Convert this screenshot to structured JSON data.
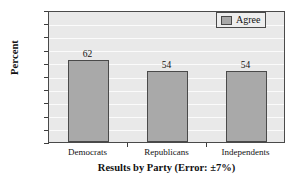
{
  "chart_data": {
    "type": "bar",
    "title": "",
    "categories": [
      "Democrats",
      "Republicans",
      "Independents"
    ],
    "values": [
      62,
      54,
      54
    ],
    "series": [
      {
        "name": "Agree",
        "values": [
          62,
          54,
          54
        ]
      }
    ],
    "xlabel": "Results by Party (Error: ±7%)",
    "ylabel": "Percent",
    "ylim": [
      0,
      100
    ],
    "yticks": [
      0,
      10,
      20,
      30,
      40,
      50,
      60,
      70,
      80,
      90,
      100
    ],
    "ytick_labels": [
      "0",
      "10",
      "20",
      "30",
      "40",
      "50",
      "60",
      "70",
      "80",
      "90",
      "100"
    ],
    "grid": true,
    "legend_position": "top-right",
    "bar_labels": [
      "62",
      "54",
      "54"
    ],
    "colors": {
      "bar_fill": "#a9a9a9",
      "bar_edge": "#4a4a4a",
      "plot_background": "#e9e9e9",
      "gridline": "#fbfbfb",
      "axis": "#4a4a4a",
      "text": "#111111",
      "legend_background": "#eeeeee"
    }
  },
  "legend": {
    "entries": [
      {
        "label": "Agree",
        "swatch_name": "legend-swatch-agree"
      }
    ]
  },
  "axes": {
    "y_title": "Percent",
    "x_title": "Results by Party (Error: ±7%)"
  }
}
